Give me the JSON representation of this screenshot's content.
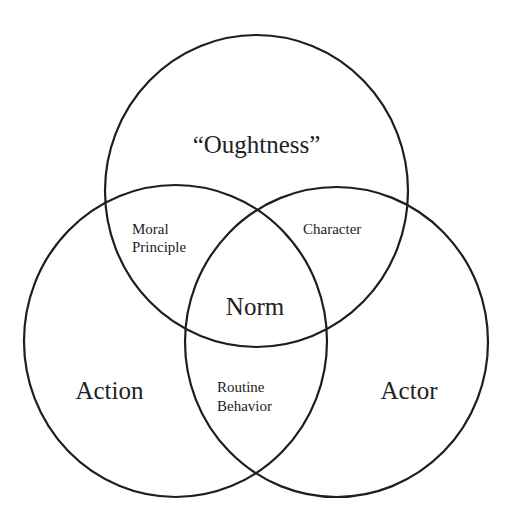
{
  "diagram": {
    "type": "venn",
    "stroke_color": "#1e1e1e",
    "text_color": "#222222",
    "background": "#ffffff",
    "sets": [
      {
        "id": "oughtness",
        "label": "“Oughtness”"
      },
      {
        "id": "action",
        "label": "Action"
      },
      {
        "id": "actor",
        "label": "Actor"
      }
    ],
    "intersections": {
      "oughtness_action": {
        "line1": "Moral",
        "line2": "Principle"
      },
      "oughtness_actor": {
        "line1": "Character"
      },
      "action_actor": {
        "line1": "Routine",
        "line2": "Behavior"
      },
      "all_three": {
        "label": "Norm"
      }
    }
  }
}
